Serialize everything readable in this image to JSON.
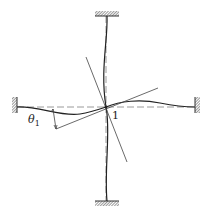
{
  "diagram": {
    "type": "structural-frame-deformation",
    "node": {
      "id": "1",
      "label": "1",
      "x": 106,
      "y": 107
    },
    "angle_label": {
      "symbol": "θ",
      "subscript": "1",
      "text": "θ1"
    },
    "supports": [
      {
        "name": "top-fixed-support",
        "orientation": "horizontal",
        "x": 95,
        "y": 11,
        "w": 24,
        "h": 5
      },
      {
        "name": "bottom-fixed-support",
        "orientation": "horizontal",
        "x": 95,
        "y": 201,
        "w": 24,
        "h": 5
      },
      {
        "name": "left-fixed-support",
        "orientation": "vertical",
        "x": 12,
        "y": 97,
        "w": 5,
        "h": 16
      },
      {
        "name": "right-fixed-support",
        "orientation": "vertical",
        "x": 195,
        "y": 97,
        "w": 5,
        "h": 16
      }
    ],
    "members": [
      "top",
      "bottom",
      "left",
      "right"
    ],
    "colors": {
      "line": "#333333",
      "dashed": "#9a9a9a",
      "hatch": "#555555"
    }
  }
}
